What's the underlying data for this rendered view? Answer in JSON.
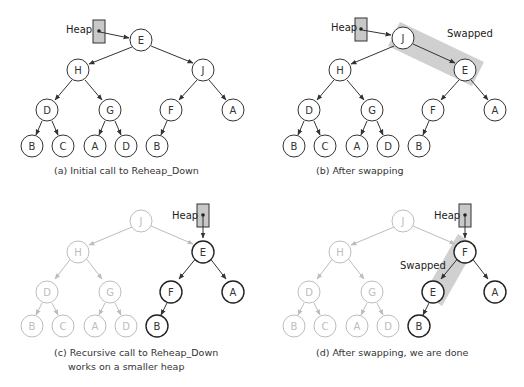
{
  "figure": {
    "panels": [
      {
        "id": "a",
        "caption": "(a) Initial call to Reheap_Down",
        "pointer_label": "Heap",
        "nodes": [
          "E",
          "H",
          "J",
          "D",
          "G",
          "F",
          "A",
          "B",
          "C",
          "A",
          "D",
          "B"
        ]
      },
      {
        "id": "b",
        "caption": "(b) After swapping",
        "pointer_label": "Heap",
        "swap_label": "Swapped",
        "nodes": [
          "J",
          "H",
          "E",
          "D",
          "G",
          "F",
          "A",
          "B",
          "C",
          "A",
          "D",
          "B"
        ]
      },
      {
        "id": "c",
        "caption_line1": "(c) Recursive call to Reheap_Down",
        "caption_line2": "works on a smaller heap",
        "pointer_label": "Heap",
        "nodes": [
          "J",
          "H",
          "E",
          "D",
          "G",
          "F",
          "A",
          "B",
          "C",
          "A",
          "D",
          "B"
        ]
      },
      {
        "id": "d",
        "caption": "(d) After swapping, we are done",
        "pointer_label": "Heap",
        "swap_label": "Swapped",
        "nodes": [
          "J",
          "H",
          "F",
          "D",
          "G",
          "E",
          "A",
          "B",
          "C",
          "A",
          "D",
          "B"
        ]
      }
    ]
  },
  "colors": {
    "active": "#333333",
    "faded": "#bdbdbd",
    "highlight": "#c8c8c8"
  }
}
